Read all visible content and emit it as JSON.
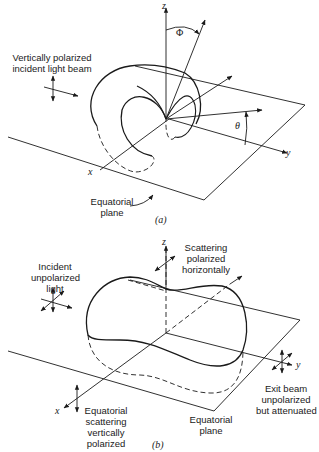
{
  "panel_a": {
    "caption": "(a)",
    "labels": {
      "beam": [
        "Vertically polarized",
        "incident light beam"
      ],
      "plane": [
        "Equatorial",
        "plane"
      ],
      "axis_z": "z",
      "axis_x": "x",
      "axis_y": "y",
      "angle_phi": "Φ",
      "angle_theta": "θ"
    }
  },
  "panel_b": {
    "caption": "(b)",
    "labels": {
      "incident": [
        "Incident",
        "unpolarized",
        "light"
      ],
      "scatter_h": [
        "Scattering",
        "polarized",
        "horizontally"
      ],
      "equatorial_scatter": [
        "Equatorial",
        "scattering",
        "vertically",
        "polarized"
      ],
      "plane": [
        "Equatorial",
        "plane"
      ],
      "exit": [
        "Exit beam",
        "unpolarized",
        "but attenuated"
      ],
      "axis_z": "z",
      "axis_x": "x",
      "axis_y": "y"
    }
  },
  "colors": {
    "ink": "#1a1a1a",
    "background": "#ffffff"
  }
}
